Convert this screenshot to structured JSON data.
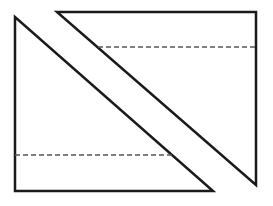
{
  "diagram": {
    "stroke_color": "#1a1a1a",
    "dash_color": "#555555",
    "shapes": [
      {
        "name": "left-triangle",
        "points": [
          [
            15,
            17
          ],
          [
            15,
            191
          ],
          [
            213,
            191
          ]
        ],
        "dashed_line": {
          "x1": 15,
          "y1": 155,
          "x2": 173,
          "y2": 155
        }
      },
      {
        "name": "right-triangle",
        "points": [
          [
            57,
            12
          ],
          [
            256,
            12
          ],
          [
            256,
            185
          ]
        ],
        "dashed_line": {
          "x1": 98,
          "y1": 47,
          "x2": 256,
          "y2": 47
        }
      }
    ]
  }
}
